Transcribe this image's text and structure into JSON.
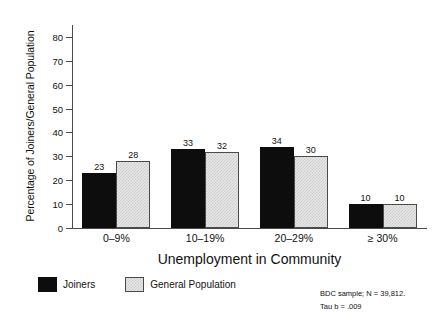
{
  "chart_data": {
    "type": "bar",
    "title": "",
    "xlabel": "Unemployment in Community",
    "ylabel": "Percentage of Joiners/General Population",
    "categories": [
      "0–9%",
      "10–19%",
      "20–29%",
      "≥ 30%"
    ],
    "series": [
      {
        "name": "Joiners",
        "values": [
          23,
          33,
          34,
          10
        ],
        "color": "#0d0d0d",
        "fill": "solid-black"
      },
      {
        "name": "General Population",
        "values": [
          28,
          32,
          30,
          10
        ],
        "color": "#e9e9e9",
        "fill": "dithered-gray"
      }
    ],
    "ylim": [
      0,
      85
    ],
    "yticks": [
      0,
      10,
      20,
      30,
      40,
      50,
      60,
      70,
      80
    ],
    "ytick_labels": [
      "0",
      "10",
      "20",
      "30",
      "40",
      "50",
      "60",
      "70",
      "80"
    ],
    "grid": false,
    "legend_position": "bottom-left",
    "show_value_labels": true,
    "annotations": [
      "BDC sample; N = 39,812.",
      "Tau b = .009"
    ]
  },
  "legend": {
    "entries": [
      {
        "label": "Joiners"
      },
      {
        "label": "General Population"
      }
    ]
  },
  "footnote": {
    "line1": "BDC sample; N = 39,812.",
    "line2": "Tau b = .009"
  }
}
